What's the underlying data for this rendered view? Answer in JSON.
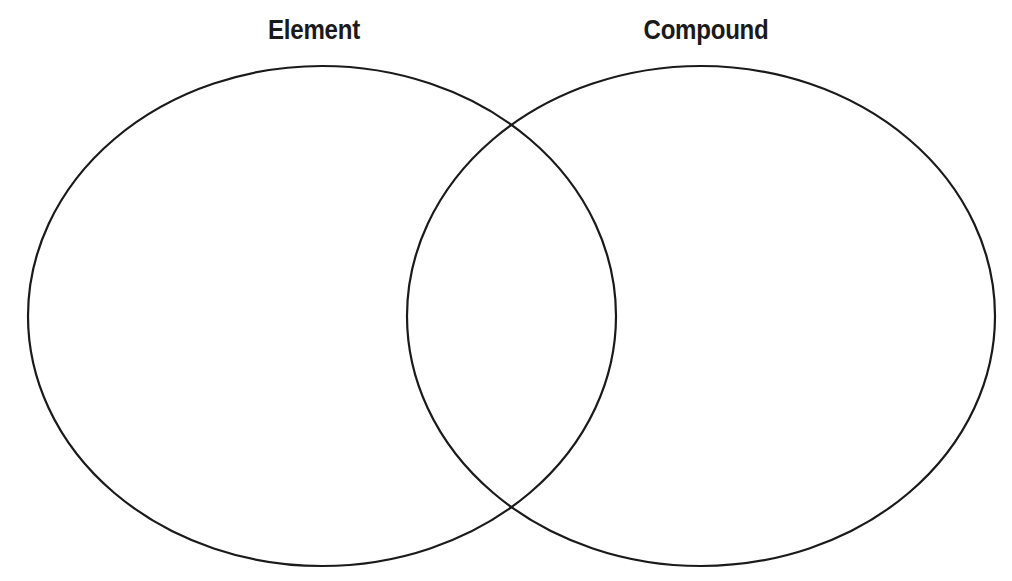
{
  "diagram": {
    "type": "venn",
    "sets": [
      {
        "label": "Element",
        "region": "left",
        "contents": []
      },
      {
        "label": "Compound",
        "region": "right",
        "contents": []
      }
    ],
    "overlap": {
      "contents": []
    },
    "stroke_color": "#1a1a1a",
    "background_color": "#ffffff"
  }
}
